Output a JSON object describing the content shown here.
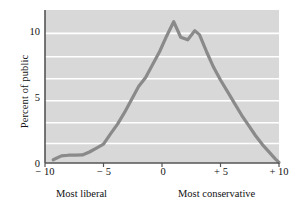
{
  "chart_data": {
    "type": "line",
    "title": "",
    "xlabel": "",
    "ylabel": "Percent of public",
    "xlim": [
      -10,
      10
    ],
    "ylim": [
      0,
      11.8
    ],
    "grid": true,
    "legend": false,
    "axis_left_caption": "Most liberal",
    "axis_right_caption": "Most conservative",
    "xticks": [
      -10,
      -5,
      0,
      5,
      10
    ],
    "xticklabels": [
      "− 10",
      "− 5",
      "0",
      "+ 5",
      "+ 10"
    ],
    "yticks": [
      0,
      5,
      10
    ],
    "yticklabels": [
      "0",
      "5",
      "10"
    ],
    "gridlines_y": [
      1.5,
      3.1,
      4.8,
      6.5,
      8.2,
      10.0
    ],
    "line_color": "#8a8a8a",
    "plot_background": "#d8d8d8",
    "gridline_color": "#ffffff",
    "axis_color": "#555555",
    "x": [
      -9.3,
      -8.6,
      -8.0,
      -7.4,
      -6.8,
      -6.2,
      -5.6,
      -5.0,
      -4.4,
      -3.8,
      -3.2,
      -2.6,
      -2.0,
      -1.4,
      -0.8,
      -0.2,
      0.4,
      1.0,
      1.6,
      2.2,
      2.8,
      3.2,
      3.8,
      4.4,
      5.0,
      5.6,
      6.2,
      6.8,
      7.4,
      8.0,
      8.6,
      9.2,
      9.7,
      10.0
    ],
    "values": [
      0.25,
      0.55,
      0.6,
      0.6,
      0.62,
      0.85,
      1.15,
      1.45,
      2.25,
      3.0,
      3.9,
      4.9,
      5.9,
      6.6,
      7.6,
      8.6,
      9.8,
      10.9,
      9.7,
      9.5,
      10.2,
      9.9,
      8.6,
      7.4,
      6.4,
      5.5,
      4.6,
      3.7,
      2.9,
      2.1,
      1.4,
      0.8,
      0.3,
      0.05
    ]
  }
}
